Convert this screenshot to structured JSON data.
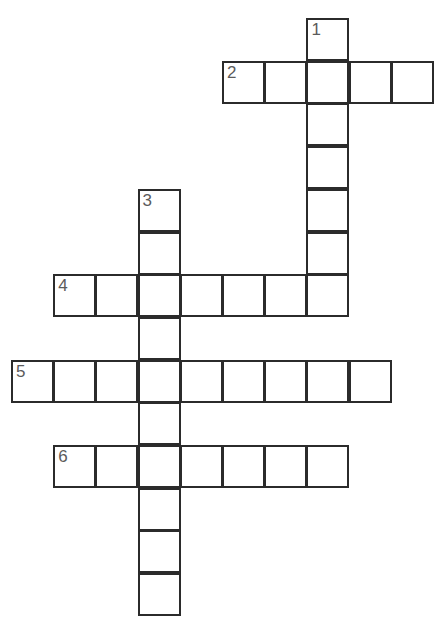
{
  "page": {
    "background_color": "#ffffff",
    "width": 439,
    "height": 634
  },
  "style": {
    "cell_border_color": "#2b2b2b",
    "cell_fill_color": "#ffffff",
    "cell_number_color": "#5b5b5b",
    "cell_size_px": 43,
    "border_width_px": 2
  },
  "grid": {
    "type": "crossword",
    "origin_x": 11,
    "origin_y": 18,
    "col_step": 42.2,
    "row_step": 42.7,
    "columns": 11,
    "rows": 14,
    "total_cells": 39
  },
  "entries": [
    {
      "number": "1",
      "direction": "down",
      "start_col": 7,
      "start_row": 0,
      "length": 7,
      "label": "1-down"
    },
    {
      "number": "2",
      "direction": "across",
      "start_col": 5,
      "start_row": 1,
      "length": 5,
      "label": "2-across"
    },
    {
      "number": "3",
      "direction": "down",
      "start_col": 3,
      "start_row": 4,
      "length": 10,
      "label": "3-down"
    },
    {
      "number": "4",
      "direction": "across",
      "start_col": 1,
      "start_row": 6,
      "length": 7,
      "label": "4-across"
    },
    {
      "number": "5",
      "direction": "across",
      "start_col": 0,
      "start_row": 8,
      "length": 9,
      "label": "5-across"
    },
    {
      "number": "6",
      "direction": "across",
      "start_col": 1,
      "start_row": 10,
      "length": 7,
      "label": "6-across"
    }
  ],
  "cells": [
    {
      "id": "c7r0",
      "col": 7,
      "row": 0,
      "number": "1",
      "letter": ""
    },
    {
      "id": "c5r1",
      "col": 5,
      "row": 1,
      "number": "2",
      "letter": ""
    },
    {
      "id": "c6r1",
      "col": 6,
      "row": 1,
      "number": "",
      "letter": ""
    },
    {
      "id": "c7r1",
      "col": 7,
      "row": 1,
      "number": "",
      "letter": ""
    },
    {
      "id": "c8r1",
      "col": 8,
      "row": 1,
      "number": "",
      "letter": ""
    },
    {
      "id": "c9r1",
      "col": 9,
      "row": 1,
      "number": "",
      "letter": ""
    },
    {
      "id": "c7r2",
      "col": 7,
      "row": 2,
      "number": "",
      "letter": ""
    },
    {
      "id": "c7r3",
      "col": 7,
      "row": 3,
      "number": "",
      "letter": ""
    },
    {
      "id": "c3r4",
      "col": 3,
      "row": 4,
      "number": "3",
      "letter": ""
    },
    {
      "id": "c7r4",
      "col": 7,
      "row": 4,
      "number": "",
      "letter": ""
    },
    {
      "id": "c3r5",
      "col": 3,
      "row": 5,
      "number": "",
      "letter": ""
    },
    {
      "id": "c7r5",
      "col": 7,
      "row": 5,
      "number": "",
      "letter": ""
    },
    {
      "id": "c1r6",
      "col": 1,
      "row": 6,
      "number": "4",
      "letter": ""
    },
    {
      "id": "c2r6",
      "col": 2,
      "row": 6,
      "number": "",
      "letter": ""
    },
    {
      "id": "c3r6",
      "col": 3,
      "row": 6,
      "number": "",
      "letter": ""
    },
    {
      "id": "c4r6",
      "col": 4,
      "row": 6,
      "number": "",
      "letter": ""
    },
    {
      "id": "c5r6",
      "col": 5,
      "row": 6,
      "number": "",
      "letter": ""
    },
    {
      "id": "c6r6",
      "col": 6,
      "row": 6,
      "number": "",
      "letter": ""
    },
    {
      "id": "c7r6",
      "col": 7,
      "row": 6,
      "number": "",
      "letter": ""
    },
    {
      "id": "c3r7",
      "col": 3,
      "row": 7,
      "number": "",
      "letter": ""
    },
    {
      "id": "c0r8",
      "col": 0,
      "row": 8,
      "number": "5",
      "letter": ""
    },
    {
      "id": "c1r8",
      "col": 1,
      "row": 8,
      "number": "",
      "letter": ""
    },
    {
      "id": "c2r8",
      "col": 2,
      "row": 8,
      "number": "",
      "letter": ""
    },
    {
      "id": "c3r8",
      "col": 3,
      "row": 8,
      "number": "",
      "letter": ""
    },
    {
      "id": "c4r8",
      "col": 4,
      "row": 8,
      "number": "",
      "letter": ""
    },
    {
      "id": "c5r8",
      "col": 5,
      "row": 8,
      "number": "",
      "letter": ""
    },
    {
      "id": "c6r8",
      "col": 6,
      "row": 8,
      "number": "",
      "letter": ""
    },
    {
      "id": "c7r8",
      "col": 7,
      "row": 8,
      "number": "",
      "letter": ""
    },
    {
      "id": "c8r8",
      "col": 8,
      "row": 8,
      "number": "",
      "letter": ""
    },
    {
      "id": "c3r9",
      "col": 3,
      "row": 9,
      "number": "",
      "letter": ""
    },
    {
      "id": "c1r10",
      "col": 1,
      "row": 10,
      "number": "6",
      "letter": ""
    },
    {
      "id": "c2r10",
      "col": 2,
      "row": 10,
      "number": "",
      "letter": ""
    },
    {
      "id": "c3r10",
      "col": 3,
      "row": 10,
      "number": "",
      "letter": ""
    },
    {
      "id": "c4r10",
      "col": 4,
      "row": 10,
      "number": "",
      "letter": ""
    },
    {
      "id": "c5r10",
      "col": 5,
      "row": 10,
      "number": "",
      "letter": ""
    },
    {
      "id": "c6r10",
      "col": 6,
      "row": 10,
      "number": "",
      "letter": ""
    },
    {
      "id": "c7r10",
      "col": 7,
      "row": 10,
      "number": "",
      "letter": ""
    },
    {
      "id": "c3r11",
      "col": 3,
      "row": 11,
      "number": "",
      "letter": ""
    },
    {
      "id": "c3r12",
      "col": 3,
      "row": 12,
      "number": "",
      "letter": ""
    },
    {
      "id": "c3r13",
      "col": 3,
      "row": 13,
      "number": "",
      "letter": ""
    }
  ]
}
